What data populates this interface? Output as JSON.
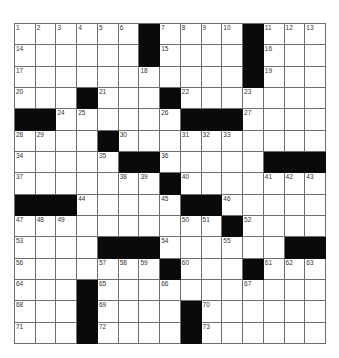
{
  "puzzle": {
    "rows": 15,
    "cols": 15,
    "grid": [
      [
        "1",
        "2",
        "3",
        "4",
        "5",
        "6",
        "#",
        "7",
        "8",
        "9",
        "10",
        "#",
        "11",
        "12",
        "13"
      ],
      [
        "14",
        "",
        "",
        "",
        "",
        "",
        "#",
        "15",
        "",
        "",
        "",
        "#",
        "16",
        "",
        ""
      ],
      [
        "17",
        "",
        "",
        "",
        "",
        "",
        "18",
        "",
        "",
        "",
        "",
        "#",
        "19",
        "",
        ""
      ],
      [
        "20",
        "",
        "",
        "#",
        "21",
        "",
        "",
        "#",
        "22",
        "",
        "",
        "23",
        "",
        "",
        ""
      ],
      [
        "#",
        "#",
        "24",
        "25",
        "",
        "",
        "",
        "26",
        "#",
        "#",
        "#",
        "27",
        "",
        "",
        ""
      ],
      [
        "28",
        "29",
        "",
        "",
        "#",
        "30",
        "",
        "",
        "31",
        "32",
        "33",
        "",
        "",
        "",
        ""
      ],
      [
        "34",
        "",
        "",
        "",
        "35",
        "#",
        "#",
        "36",
        "",
        "",
        "",
        "",
        "#",
        "#",
        "#"
      ],
      [
        "37",
        "",
        "",
        "",
        "",
        "38",
        "39",
        "#",
        "40",
        "",
        "",
        "",
        "41",
        "42",
        "43"
      ],
      [
        "#",
        "#",
        "#",
        "44",
        "",
        "",
        "",
        "45",
        "#",
        "#",
        "46",
        "",
        "",
        "",
        ""
      ],
      [
        "47",
        "48",
        "49",
        "",
        "",
        "",
        "",
        "",
        "50",
        "51",
        "#",
        "52",
        "",
        "",
        ""
      ],
      [
        "53",
        "",
        "",
        "",
        "#",
        "#",
        "#",
        "54",
        "",
        "",
        "55",
        "",
        "",
        "#",
        "#"
      ],
      [
        "56",
        "",
        "",
        "",
        "57",
        "58",
        "59",
        "#",
        "60",
        "",
        "",
        "#",
        "61",
        "62",
        "63"
      ],
      [
        "64",
        "",
        "",
        "#",
        "65",
        "",
        "",
        "66",
        "",
        "",
        "",
        "67",
        "",
        "",
        ""
      ],
      [
        "68",
        "",
        "",
        "#",
        "69",
        "",
        "",
        "",
        "#",
        "70",
        "",
        "",
        "",
        "",
        ""
      ],
      [
        "71",
        "",
        "",
        "#",
        "72",
        "",
        "",
        "",
        "#",
        "73",
        "",
        "",
        "",
        "",
        ""
      ]
    ]
  },
  "colors": {
    "block": "#0a0a0a",
    "grid_line": "#6e6e6e",
    "cell": "#ffffff"
  }
}
